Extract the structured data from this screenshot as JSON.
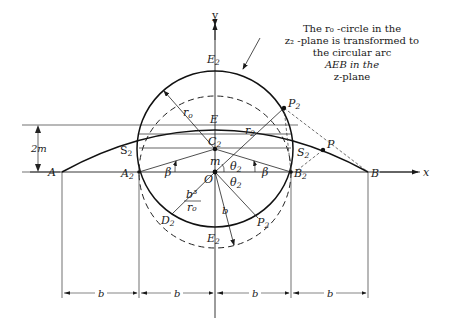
{
  "figure": {
    "caption_lines": [
      "The r₀ -circle in the",
      "z₂ -plane is transformed to",
      "the circular arc",
      "AEB in the",
      "z-plane"
    ],
    "axis_labels": {
      "x": "x",
      "y": "y"
    },
    "points": {
      "A": "A",
      "A2": "A",
      "O": "O",
      "B2": "B",
      "B": "B",
      "E2": "E",
      "E": "E",
      "C2": "C",
      "S2": "S",
      "S2p": "S",
      "P2": "P",
      "P": "P",
      "D2": "D",
      "P2p": "P",
      "E2p": "E"
    },
    "subscripts": {
      "two": "2",
      "prime": "′"
    },
    "quantities": {
      "r0": "r",
      "r0_sub": "o",
      "r2": "r",
      "r2_sub": "2",
      "m": "m",
      "two_m": "2m",
      "beta": "β",
      "theta2": "θ",
      "theta2_sub": "2",
      "b": "b",
      "b3_num": "b³",
      "b3_den": "r₀"
    },
    "dimensions": [
      "b",
      "b",
      "b",
      "b"
    ]
  }
}
